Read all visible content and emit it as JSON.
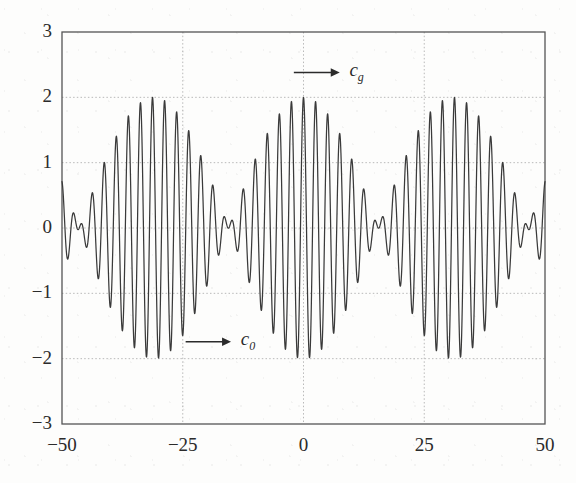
{
  "figure": {
    "kind": "wave-packet-dispersion-plot",
    "background_color": "#fdfdfc",
    "line_color": "#3a3a3a",
    "grid_color": "#b9b9b9",
    "axis_color": "#555555",
    "text_color": "#2b2b2b"
  },
  "axes": {
    "x_ticks": [
      "-50",
      "-25",
      "0",
      "25",
      "50"
    ],
    "x_tick_values": [
      -50,
      -25,
      0,
      25,
      50
    ],
    "y_ticks": [
      "3",
      "2",
      "1",
      "0",
      "-1",
      "-2",
      "-3"
    ],
    "y_tick_values": [
      3,
      2,
      1,
      0,
      -1,
      -2,
      -3
    ],
    "xlim": [
      -50,
      50
    ],
    "ylim": [
      -3,
      3
    ],
    "grid": true
  },
  "annotations": {
    "group_velocity": {
      "label_base": "c",
      "label_sub": "g",
      "arrow_direction": "right",
      "arrow_x_start": -2.0,
      "arrow_x_end": 7.5,
      "arrow_y": 2.38,
      "label_x": 9.5
    },
    "phase_velocity": {
      "label_base": "c",
      "label_sub": "0",
      "arrow_direction": "right",
      "arrow_x_start": -24.4,
      "arrow_x_end": -15.0,
      "arrow_y": -1.74,
      "label_x": -13.0
    }
  },
  "chart_data": {
    "type": "line",
    "title": "",
    "xlabel": "",
    "ylabel": "",
    "xlim": [
      -50,
      50
    ],
    "ylim": [
      -3,
      3
    ],
    "grid": true,
    "legend": "none",
    "formula": "y = cos(k1*x) + cos(k2*x)",
    "parameters": {
      "k1": 2.614,
      "k2": 2.411,
      "carrier_wavenumber": 2.5125,
      "carrier_wavelength": 2.5,
      "envelope_wavenumber": 0.1014,
      "envelope_period": 31.0,
      "amplitude_max": 2.0,
      "amplitude_min": 0.0
    },
    "envelope_antinodes_x": [
      -31.0,
      0.0,
      31.0
    ],
    "envelope_nodes_x": [
      -46.5,
      -15.5,
      15.5,
      46.5
    ],
    "samples": 2400
  }
}
